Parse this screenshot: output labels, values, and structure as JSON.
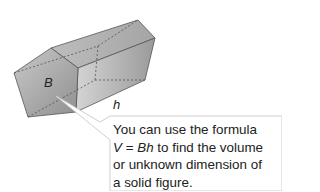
{
  "figure": {
    "type": "pentagonal-prism",
    "base_label": "B",
    "height_label": "h"
  },
  "callout": {
    "line1": "You can use the formula",
    "line2_formula_v": "V",
    "line2_eq": " = ",
    "line2_formula_bh": "Bh",
    "line2_rest": " to find the volume",
    "line3": "or unknown dimension of",
    "line4": "a solid figure."
  }
}
